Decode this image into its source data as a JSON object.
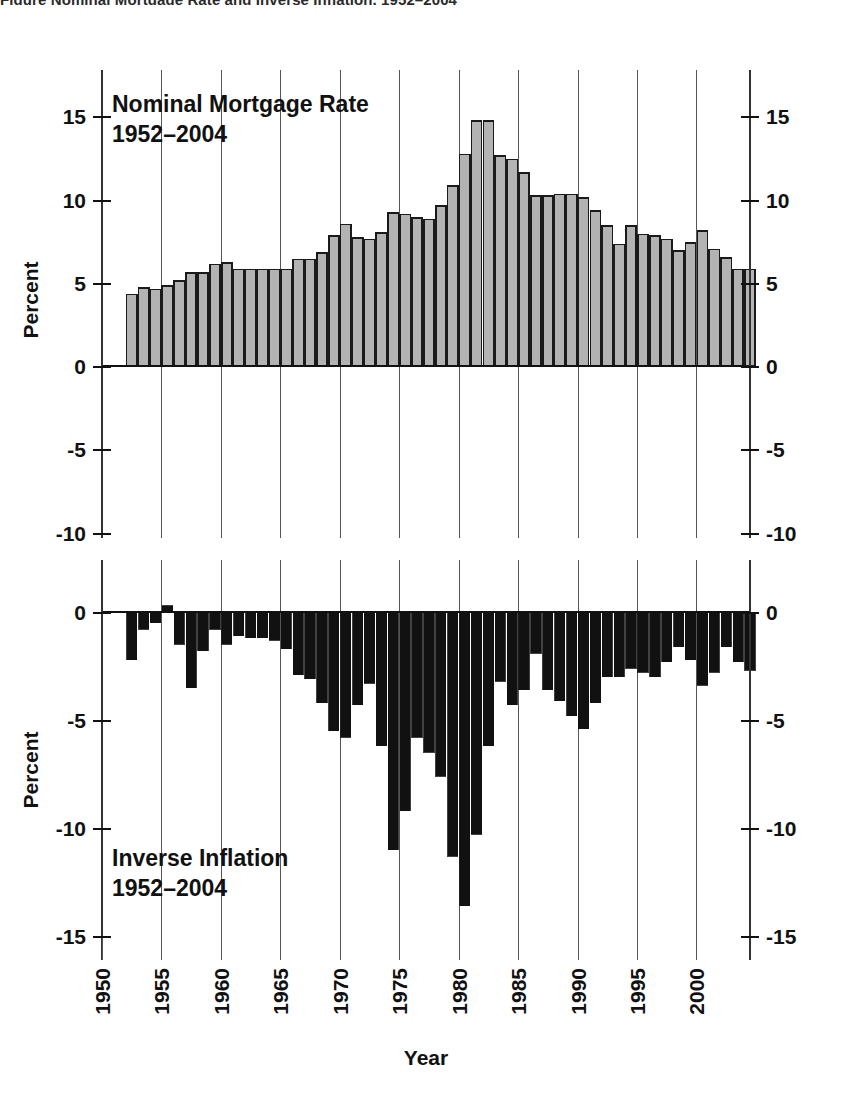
{
  "figure": {
    "clipped_top_caption": "Figure   Nominal Mortgage Rate and Inverse Inflation, 1952–2004",
    "xlabel": "Year",
    "ylabel_top": "Percent",
    "ylabel_bottom": "Percent"
  },
  "chart_data": [
    {
      "type": "bar",
      "panel": "top",
      "title": "Nominal Mortgage Rate",
      "subtitle": "1952–2004",
      "xlabel": "Year",
      "ylabel": "Percent",
      "xlim": [
        1950,
        2004.5
      ],
      "ylim": [
        -10,
        16.5
      ],
      "yticks": [
        15,
        10,
        5,
        0,
        -5,
        -10
      ],
      "ytick_labels": [
        "15",
        "10",
        "5",
        "0",
        "-5",
        "-10"
      ],
      "xticks": [
        1950,
        1955,
        1960,
        1965,
        1970,
        1975,
        1980,
        1985,
        1990,
        1995,
        2000
      ],
      "xtick_labels": [
        "1950",
        "1955",
        "1960",
        "1965",
        "1970",
        "1975",
        "1980",
        "1985",
        "1990",
        "1995",
        "2000"
      ],
      "grid": "vertical-only",
      "bar_fill": "#b3b3b3",
      "bar_edge": "#1a1a1a",
      "categories": [
        1952,
        1953,
        1954,
        1955,
        1956,
        1957,
        1958,
        1959,
        1960,
        1961,
        1962,
        1963,
        1964,
        1965,
        1966,
        1967,
        1968,
        1969,
        1970,
        1971,
        1972,
        1973,
        1974,
        1975,
        1976,
        1977,
        1978,
        1979,
        1980,
        1981,
        1982,
        1983,
        1984,
        1985,
        1986,
        1987,
        1988,
        1989,
        1990,
        1991,
        1992,
        1993,
        1994,
        1995,
        1996,
        1997,
        1998,
        1999,
        2000,
        2001,
        2002,
        2003,
        2004
      ],
      "values": [
        4.3,
        4.7,
        4.6,
        4.8,
        5.1,
        5.6,
        5.6,
        6.1,
        6.2,
        5.8,
        5.8,
        5.8,
        5.8,
        5.8,
        6.4,
        6.4,
        6.8,
        7.8,
        8.5,
        7.7,
        7.6,
        8.0,
        9.2,
        9.1,
        8.9,
        8.8,
        9.6,
        10.8,
        12.7,
        14.7,
        14.7,
        12.6,
        12.4,
        11.6,
        10.2,
        10.2,
        10.3,
        10.3,
        10.1,
        9.3,
        8.4,
        7.3,
        8.4,
        7.9,
        7.8,
        7.6,
        6.9,
        7.4,
        8.1,
        7.0,
        6.5,
        5.8,
        5.8
      ],
      "peak": {
        "year": 1981,
        "value": 15.8
      }
    },
    {
      "type": "bar",
      "panel": "bottom",
      "title": "Inverse Inflation",
      "subtitle": "1952–2004",
      "xlabel": "Year",
      "ylabel": "Percent",
      "xlim": [
        1950,
        2004.5
      ],
      "ylim": [
        -15,
        0.6
      ],
      "yticks": [
        0,
        -5,
        -10,
        -15
      ],
      "ytick_labels": [
        "0",
        "-5",
        "-10",
        "-15"
      ],
      "xticks": [
        1950,
        1955,
        1960,
        1965,
        1970,
        1975,
        1980,
        1985,
        1990,
        1995,
        2000
      ],
      "xtick_labels": [
        "1950",
        "1955",
        "1960",
        "1965",
        "1970",
        "1975",
        "1980",
        "1985",
        "1990",
        "1995",
        "2000"
      ],
      "grid": "vertical-only",
      "bar_fill": "#111111",
      "bar_edge": "#111111",
      "categories": [
        1952,
        1953,
        1954,
        1955,
        1956,
        1957,
        1958,
        1959,
        1960,
        1961,
        1962,
        1963,
        1964,
        1965,
        1966,
        1967,
        1968,
        1969,
        1970,
        1971,
        1972,
        1973,
        1974,
        1975,
        1976,
        1977,
        1978,
        1979,
        1980,
        1981,
        1982,
        1983,
        1984,
        1985,
        1986,
        1987,
        1988,
        1989,
        1990,
        1991,
        1992,
        1993,
        1994,
        1995,
        1996,
        1997,
        1998,
        1999,
        2000,
        2001,
        2002,
        2003,
        2004
      ],
      "values": [
        -2.2,
        -0.8,
        -0.5,
        0.3,
        -1.5,
        -3.5,
        -1.8,
        -0.8,
        -1.5,
        -1.1,
        -1.2,
        -1.2,
        -1.3,
        -1.7,
        -2.9,
        -3.1,
        -4.2,
        -5.5,
        -5.8,
        -4.3,
        -3.3,
        -6.2,
        -11.0,
        -9.2,
        -5.8,
        -6.5,
        -7.6,
        -11.3,
        -13.6,
        -10.3,
        -6.2,
        -3.2,
        -4.3,
        -3.6,
        -1.9,
        -3.6,
        -4.1,
        -4.8,
        -5.4,
        -4.2,
        -3.0,
        -3.0,
        -2.6,
        -2.8,
        -3.0,
        -2.3,
        -1.6,
        -2.2,
        -3.4,
        -2.8,
        -1.6,
        -2.3,
        -2.7
      ],
      "deepest": {
        "year": 1980,
        "value": -13.6
      }
    }
  ]
}
